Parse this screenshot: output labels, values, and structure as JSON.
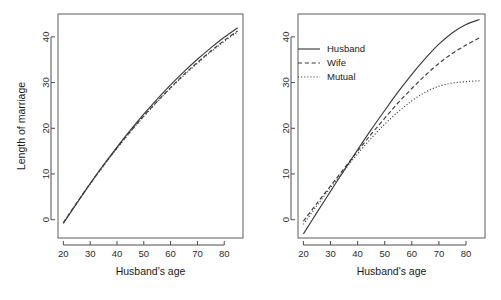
{
  "figure": {
    "width": 501,
    "height": 300,
    "background": "#ffffff",
    "ink_color": "#3b3b3b"
  },
  "chart_data": [
    {
      "type": "line",
      "panel": "left",
      "title": "",
      "xlabel": "Husband's age",
      "ylabel": "Length of marriage",
      "xlim": [
        18,
        87
      ],
      "ylim": [
        -4,
        45
      ],
      "xticks": [
        20,
        30,
        40,
        50,
        60,
        70,
        80
      ],
      "yticks": [
        0,
        10,
        20,
        30,
        40
      ],
      "grid": false,
      "legend": null,
      "x": [
        20,
        25,
        30,
        35,
        40,
        45,
        50,
        55,
        60,
        65,
        70,
        75,
        80,
        85
      ],
      "series": [
        {
          "name": "Husband",
          "style": "solid",
          "values": [
            -0.8,
            3.6,
            7.9,
            12.0,
            15.9,
            19.6,
            23.1,
            26.4,
            29.5,
            32.4,
            35.1,
            37.6,
            39.9,
            42.0
          ]
        },
        {
          "name": "Wife",
          "style": "dashed",
          "values": [
            -0.6,
            3.7,
            7.9,
            11.9,
            15.7,
            19.3,
            22.7,
            25.9,
            28.9,
            31.8,
            34.4,
            36.9,
            39.2,
            41.3
          ]
        },
        {
          "name": "Mutual",
          "style": "dotted",
          "values": [
            -0.7,
            3.6,
            7.8,
            11.8,
            15.6,
            19.2,
            22.6,
            25.8,
            28.8,
            31.6,
            34.2,
            36.7,
            39.0,
            41.1
          ]
        }
      ]
    },
    {
      "type": "line",
      "panel": "right",
      "title": "",
      "xlabel": "Husband's age",
      "ylabel": "",
      "xlim": [
        18,
        87
      ],
      "ylim": [
        -4,
        45
      ],
      "xticks": [
        20,
        30,
        40,
        50,
        60,
        70,
        80
      ],
      "yticks": [
        0,
        10,
        20,
        30,
        40
      ],
      "grid": false,
      "legend": {
        "position": "top-left",
        "entries": [
          "Husband",
          "Wife",
          "Mutual"
        ],
        "styles": [
          "solid",
          "dashed",
          "dotted"
        ]
      },
      "x": [
        20,
        25,
        30,
        35,
        40,
        45,
        50,
        55,
        60,
        65,
        70,
        75,
        80,
        85
      ],
      "series": [
        {
          "name": "Husband",
          "style": "solid",
          "values": [
            -3.1,
            1.6,
            6.2,
            10.8,
            15.3,
            19.7,
            23.9,
            28.0,
            31.8,
            35.3,
            38.4,
            40.9,
            42.7,
            43.8
          ]
        },
        {
          "name": "Wife",
          "style": "dashed",
          "values": [
            -0.3,
            3.6,
            7.4,
            11.2,
            15.0,
            18.7,
            22.2,
            25.6,
            28.7,
            31.6,
            34.2,
            36.4,
            38.2,
            39.8
          ]
        },
        {
          "name": "Mutual",
          "style": "dotted",
          "values": [
            -1.0,
            3.1,
            7.0,
            10.8,
            14.4,
            17.8,
            20.9,
            23.6,
            26.0,
            27.9,
            29.2,
            29.9,
            30.2,
            30.4
          ]
        }
      ]
    }
  ]
}
